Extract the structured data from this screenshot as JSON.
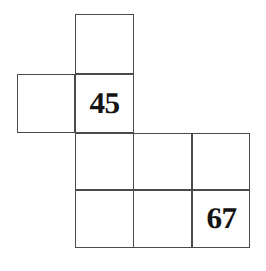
{
  "figure": {
    "kind": "cube-net-diagram",
    "background_color": "#ffffff",
    "line_color": "#4a4a4a",
    "text_color": "#141414",
    "line_width_px": 1.6,
    "canvas": {
      "width": 266,
      "height": 271
    },
    "grid": {
      "column_edges_px": [
        17,
        75,
        133,
        192,
        250
      ],
      "row_edges_px": [
        14,
        74,
        133,
        190,
        248
      ],
      "cell_size_px": 58
    },
    "cells": [
      {
        "name": "top-face",
        "label": "",
        "x": 75,
        "y": 14,
        "w": 59,
        "h": 60
      },
      {
        "name": "left-face",
        "label": "",
        "x": 17,
        "y": 74,
        "w": 58,
        "h": 59
      },
      {
        "name": "center-face-45",
        "label": "45",
        "x": 75,
        "y": 74,
        "w": 59,
        "h": 59
      },
      {
        "name": "middle-face",
        "label": "",
        "x": 75,
        "y": 133,
        "w": 59,
        "h": 57
      },
      {
        "name": "right-upper-face",
        "label": "",
        "x": 192,
        "y": 133,
        "w": 58,
        "h": 57
      },
      {
        "name": "bottom-face",
        "label": "",
        "x": 75,
        "y": 190,
        "w": 59,
        "h": 58
      },
      {
        "name": "right-lower-face-67",
        "label": "67",
        "x": 192,
        "y": 190,
        "w": 58,
        "h": 58
      },
      {
        "name": "inner-bridge-upper",
        "label": "",
        "x": 133,
        "y": 133,
        "w": 59,
        "h": 57
      },
      {
        "name": "inner-bridge-lower",
        "label": "",
        "x": 133,
        "y": 190,
        "w": 59,
        "h": 58
      }
    ],
    "numbered_faces": [
      {
        "position": "center",
        "value": "45"
      },
      {
        "position": "bottom-right",
        "value": "67"
      }
    ]
  }
}
